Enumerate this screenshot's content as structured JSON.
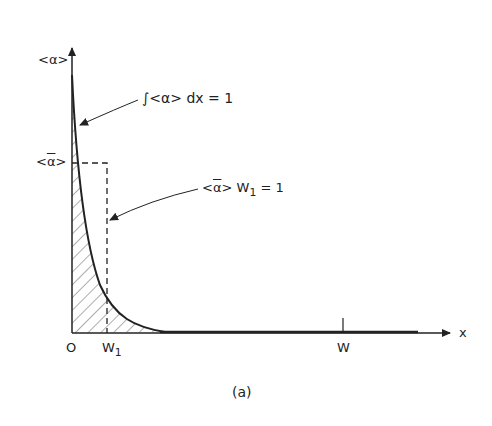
{
  "figure": {
    "caption": "(a)",
    "y_axis_label": "<α>",
    "x_axis_label": "x",
    "mean_level_label_left": "<",
    "mean_level_label_sym": "α",
    "mean_level_label_right": ">",
    "origin_label": "O",
    "w1_label": "W",
    "w1_sub": "1",
    "w_label": "W",
    "annotation_integral": "∫<α> dx = 1",
    "annotation_product_left": "<",
    "annotation_product_sym": "α",
    "annotation_product_right": "> W",
    "annotation_product_sub": "1",
    "annotation_product_eq": " = 1"
  },
  "colors": {
    "ink": "#222222",
    "background": "#ffffff"
  }
}
